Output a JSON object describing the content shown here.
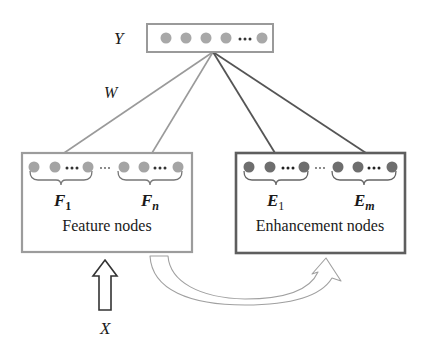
{
  "diagram": {
    "colors": {
      "output_box_border": "#9a9a9a",
      "output_node": "#a8a8a8",
      "feature_box_border": "#9c9c9c",
      "feature_node": "#a4a4a4",
      "enhancement_box_border": "#5e5e5e",
      "enhancement_node": "#6e6e6e",
      "edge_light": "#9a9a9a",
      "edge_dark": "#555555",
      "arrow_outline": "#333333",
      "curve_arrow_outline": "#a0a0a0"
    },
    "output": {
      "label": "Y",
      "nodes": [
        "y1",
        "y2",
        "y3",
        "y4",
        "...",
        "yk"
      ],
      "ellipsis": "•••"
    },
    "weights": {
      "label": "W"
    },
    "feature_layer": {
      "caption": "Feature nodes",
      "group_first_label": "F",
      "group_first_sub": "1",
      "group_last_label": "F",
      "group_last_sub": "n",
      "between_groups": "···",
      "within_group": "•••"
    },
    "enhancement_layer": {
      "caption": "Enhancement nodes",
      "group_first_label": "E",
      "group_first_sub": "1",
      "group_last_label": "E",
      "group_last_sub": "m",
      "between_groups": "···",
      "within_group": "•••"
    },
    "input": {
      "label": "X"
    }
  }
}
